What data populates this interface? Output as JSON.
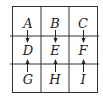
{
  "diagram": {
    "rows": 3,
    "cols": 3,
    "cells": [
      {
        "label": "A",
        "row": 0,
        "col": 0
      },
      {
        "label": "B",
        "row": 0,
        "col": 1
      },
      {
        "label": "C",
        "row": 0,
        "col": 2
      },
      {
        "label": "D",
        "row": 1,
        "col": 0
      },
      {
        "label": "E",
        "row": 1,
        "col": 1
      },
      {
        "label": "F",
        "row": 1,
        "col": 2
      },
      {
        "label": "G",
        "row": 2,
        "col": 0
      },
      {
        "label": "H",
        "row": 2,
        "col": 1
      },
      {
        "label": "I",
        "row": 2,
        "col": 2
      }
    ],
    "arrows": [
      {
        "from": "A",
        "to": "D",
        "direction": "down"
      },
      {
        "from": "B",
        "to": "E",
        "direction": "down"
      },
      {
        "from": "C",
        "to": "F",
        "direction": "down"
      },
      {
        "from": "G",
        "to": "D",
        "direction": "up"
      },
      {
        "from": "H",
        "to": "E",
        "direction": "up"
      },
      {
        "from": "I",
        "to": "F",
        "direction": "up"
      }
    ],
    "colors": {
      "line": "#333333",
      "text": "#222222",
      "background": "#ffffff"
    }
  }
}
